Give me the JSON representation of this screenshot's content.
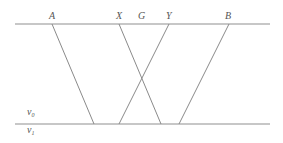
{
  "diagram": {
    "top_labels": [
      {
        "id": "A",
        "text": "A"
      },
      {
        "id": "X",
        "text": "X"
      },
      {
        "id": "G",
        "text": "G"
      },
      {
        "id": "Y",
        "text": "Y"
      },
      {
        "id": "B",
        "text": "B"
      }
    ],
    "regions": {
      "upper": {
        "base": "v",
        "subscript": "0"
      },
      "lower": {
        "base": "v",
        "subscript": "1"
      }
    },
    "rays": [
      {
        "from": "A",
        "direction": "right"
      },
      {
        "from": "X",
        "direction": "right"
      },
      {
        "from": "Y",
        "direction": "left"
      },
      {
        "from": "B",
        "direction": "left"
      }
    ],
    "colors": {
      "line": "#8a8a8a",
      "text": "#555555"
    }
  }
}
